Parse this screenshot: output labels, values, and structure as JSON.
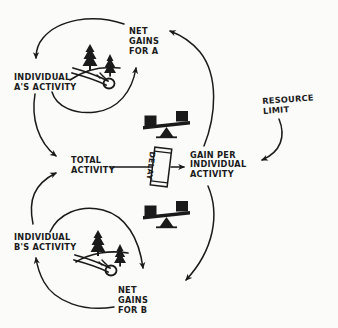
{
  "diagram": {
    "style": "hand-drawn ink sketch",
    "background_color": "#fbfbfa",
    "ink_color": "#1a1a1a",
    "nodes": [
      {
        "id": "net_gains_a",
        "label": "NET\nGAINS\nFOR A",
        "x": 129,
        "y": 26
      },
      {
        "id": "individual_a",
        "label": "INDIVIDUAL\nA's ACTIVITY",
        "x": 14,
        "y": 72
      },
      {
        "id": "total_activity",
        "label": "TOTAL\nACTIVITY",
        "x": 71,
        "y": 155
      },
      {
        "id": "gain_per_individual",
        "label": "GAIN PER\nINDIVIDUAL\nACTIVITY",
        "x": 190,
        "y": 151
      },
      {
        "id": "resource_limit",
        "label": "RESOURCE\nLIMIT",
        "x": 262,
        "y": 96
      },
      {
        "id": "individual_b",
        "label": "INDIVIDUAL\nB's ACTIVITY",
        "x": 14,
        "y": 232
      },
      {
        "id": "net_gains_b",
        "label": "NET\nGAINS\nFOR B",
        "x": 118,
        "y": 285
      }
    ],
    "delay_marker": {
      "label": "DELAY",
      "x": 157,
      "y": 152
    },
    "icons": [
      {
        "name": "balance-scale-icon",
        "x": 142,
        "y": 110
      },
      {
        "name": "balance-scale-icon",
        "x": 142,
        "y": 200
      },
      {
        "name": "logging-trees-icon",
        "x": 70,
        "y": 40
      },
      {
        "name": "logging-trees-icon",
        "x": 72,
        "y": 228
      }
    ],
    "links": [
      {
        "from": "net_gains_a",
        "to": "individual_a",
        "kind": "curved-arrow"
      },
      {
        "from": "individual_a",
        "to": "net_gains_a",
        "kind": "curved-arrow"
      },
      {
        "from": "individual_a",
        "to": "total_activity",
        "kind": "curved-arrow"
      },
      {
        "from": "total_activity",
        "to": "gain_per_individual",
        "kind": "straight-arrow-with-delay"
      },
      {
        "from": "gain_per_individual",
        "to": "net_gains_a",
        "kind": "curved-arrow"
      },
      {
        "from": "resource_limit",
        "to": "gain_per_individual",
        "kind": "curved-arrow"
      },
      {
        "from": "gain_per_individual",
        "to": "net_gains_b",
        "kind": "curved-arrow"
      },
      {
        "from": "net_gains_b",
        "to": "individual_b",
        "kind": "curved-arrow"
      },
      {
        "from": "individual_b",
        "to": "net_gains_b",
        "kind": "curved-arrow"
      },
      {
        "from": "individual_b",
        "to": "total_activity",
        "kind": "curved-arrow"
      }
    ]
  }
}
